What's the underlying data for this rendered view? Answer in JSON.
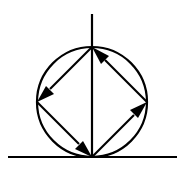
{
  "figure": {
    "canvas": {
      "width": 185,
      "height": 182
    },
    "background_color": "#ffffff",
    "ink_color": "#000000"
  },
  "circle": {
    "name": "circle",
    "center_x": 92,
    "center_y": 102,
    "radius": 55,
    "stroke_color": "#000000",
    "stroke_width": 2.2,
    "fill": "none"
  },
  "axes": {
    "vertical": {
      "label": "vertical-axis",
      "x": 92,
      "y_start": 14,
      "y_end": 157,
      "stroke_color": "#000000",
      "stroke_width": 2.2
    },
    "horizontal": {
      "label": "horizontal-axis",
      "y": 157,
      "x_start": 8,
      "x_end": 177,
      "stroke_color": "#000000",
      "stroke_width": 2.2
    }
  },
  "vertices": {
    "top": {
      "label": "top-vertex",
      "x": 92,
      "y": 47
    },
    "right": {
      "label": "right-vertex",
      "x": 147,
      "y": 102
    },
    "bottom": {
      "label": "bottom-vertex",
      "x": 92,
      "y": 157
    },
    "left": {
      "label": "left-vertex",
      "x": 37,
      "y": 102
    }
  },
  "vectors": [
    {
      "name": "vector-bottom-to-right",
      "from": "bottom",
      "to": "right",
      "x1": 92,
      "y1": 157,
      "x2": 147,
      "y2": 102,
      "shaft_x2": 134,
      "shaft_y2": 115,
      "head_points": "147,102 130,110 138,118",
      "direction": "up-right",
      "stroke_color": "#000000",
      "stroke_width": 2.2
    },
    {
      "name": "vector-right-to-top",
      "from": "right",
      "to": "top",
      "x1": 147,
      "y1": 102,
      "x2": 92,
      "y2": 47,
      "shaft_x2": 105,
      "shaft_y2": 60,
      "head_points": "92,47 101,64 109,56",
      "direction": "up-left",
      "stroke_color": "#000000",
      "stroke_width": 2.2
    },
    {
      "name": "vector-top-to-left",
      "from": "top",
      "to": "left",
      "x1": 92,
      "y1": 47,
      "x2": 37,
      "y2": 102,
      "shaft_x2": 50,
      "shaft_y2": 89,
      "head_points": "37,102 54,94 46,86",
      "direction": "down-left",
      "stroke_color": "#000000",
      "stroke_width": 2.2
    },
    {
      "name": "vector-left-to-bottom",
      "from": "left",
      "to": "bottom",
      "x1": 37,
      "y1": 102,
      "x2": 92,
      "y2": 157,
      "shaft_x2": 79,
      "shaft_y2": 144,
      "head_points": "92,157 75,149 83,141",
      "direction": "down-right",
      "stroke_color": "#000000",
      "stroke_width": 2.2
    }
  ]
}
